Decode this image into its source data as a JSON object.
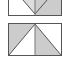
{
  "icons": [
    {
      "name": "split-v-shape-icon",
      "fill": "#cccccc",
      "stroke": "#555555"
    },
    {
      "name": "split-inverted-v-shape-icon",
      "fill": "#cccccc",
      "stroke": "#555555"
    }
  ],
  "label": {
    "text": "........"
  }
}
